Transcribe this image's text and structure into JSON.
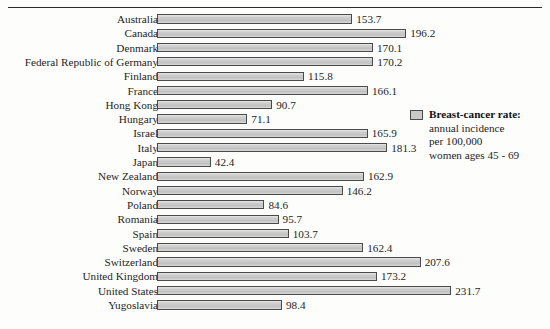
{
  "figure": {
    "clipped_title": "",
    "legend": {
      "swatch_color": "#c9c9c9",
      "title": "Breast-cancer rate:",
      "lines": [
        "annual incidence",
        "per 100,000",
        "women ages 45 - 69"
      ]
    }
  },
  "chart_data": {
    "type": "bar",
    "orientation": "horizontal",
    "xlabel": "",
    "ylabel": "",
    "xlim": [
      0,
      231.7
    ],
    "grid": false,
    "legend_position": "right",
    "bar_color": "#c9c9c9",
    "bar_border_color": "#4a4a4a",
    "series_name": "Breast-cancer rate: annual incidence per 100,000 women ages 45-69",
    "categories": [
      "Australia",
      "Canada",
      "Denmark",
      "Federal Republic of Germany",
      "Finland",
      "France",
      "Hong Kong",
      "Hungary",
      "Israel",
      "Italy",
      "Japan",
      "New Zealand",
      "Norway",
      "Poland",
      "Romania",
      "Spain",
      "Sweden",
      "Switzerland",
      "United Kingdom",
      "United States",
      "Yugoslavia"
    ],
    "values": [
      153.7,
      196.2,
      170.1,
      170.2,
      115.8,
      166.1,
      90.7,
      71.1,
      165.9,
      181.3,
      42.4,
      162.9,
      146.2,
      84.6,
      95.7,
      103.7,
      162.4,
      207.6,
      173.2,
      231.7,
      98.4
    ],
    "value_labels": [
      "153.7",
      "196.2",
      "170.1",
      "170.2",
      "115.8",
      "166.1",
      "90.7",
      "71.1",
      "165.9",
      "181.3",
      "42.4",
      "162.9",
      "146.2",
      "84.6",
      "95.7",
      "103.7",
      "162.4",
      "207.6",
      "173.2",
      "231.7",
      "98.4"
    ]
  }
}
